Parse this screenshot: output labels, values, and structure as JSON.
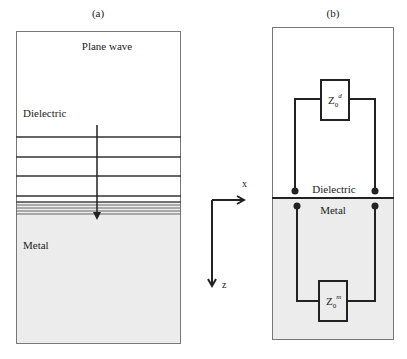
{
  "panel_a": {
    "label": "(a)",
    "plane_wave": "Plane wave",
    "dielectric": "Dielectric",
    "metal": "Metal"
  },
  "axes": {
    "x_label": "x",
    "z_label": "z"
  },
  "panel_b": {
    "label": "(b)",
    "dielectric": "Dielectric",
    "metal": "Metal",
    "z_top": {
      "base": "Z",
      "sub": "0",
      "sup": "d"
    },
    "z_bottom": {
      "base": "Z",
      "sub": "0",
      "sup": "m"
    }
  },
  "colors": {
    "line": "#222222",
    "metal_fill": "#ececec",
    "border": "#777777"
  }
}
